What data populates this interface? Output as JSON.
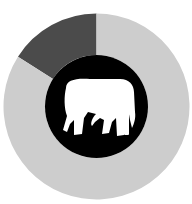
{
  "chart_data": {
    "type": "pie",
    "variant": "donut",
    "title": "",
    "categories": [
      "Highlighted share",
      "Remainder"
    ],
    "values": [
      16,
      84
    ],
    "colors": [
      "#4b4b4b",
      "#cdcdcd"
    ],
    "center_icon": "elephant-icon",
    "center_color": "#000000",
    "icon_color": "#ffffff",
    "legend": "none"
  }
}
